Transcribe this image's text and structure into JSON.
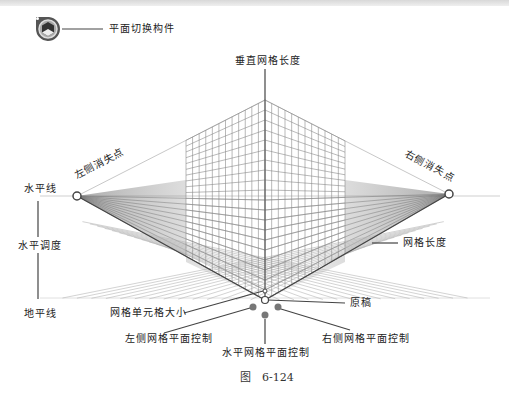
{
  "figure": {
    "caption": "图　6-124",
    "labels": {
      "plane_switch_widget": "平面切换构件",
      "vertical_grid_extent": "垂直网格长度",
      "left_vanishing_point": "左侧消失点",
      "right_vanishing_point": "右侧消失点",
      "horizon_line": "水平线",
      "horizon_height": "水平调度",
      "ground_level": "地平线",
      "grid_extent": "网格长度",
      "grid_cell_size": "网格单元格大小",
      "origin": "原稿",
      "left_grid_plane_control": "左侧网格平面控制",
      "horizontal_grid_plane_control": "水平网格平面控制",
      "right_grid_plane_control": "右侧网格平面控制"
    }
  },
  "colors": {
    "grid_line": "#8a8a8a",
    "leader_line": "#444444",
    "control_dot": "#777777",
    "widget_dark": "#555555"
  }
}
